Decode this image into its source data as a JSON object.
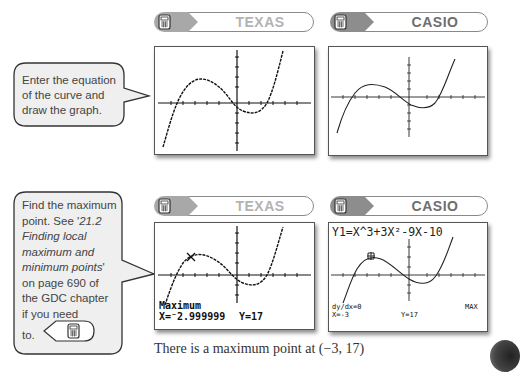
{
  "headers": {
    "texas_label": "TEXAS",
    "casio_label": "CASIO",
    "calculator_icon": "calculator-icon"
  },
  "step1": {
    "instruction": "Enter the equation of the curve and draw the graph.",
    "instruction_lines": [
      "Enter the equation",
      "of the curve and",
      "draw the graph."
    ]
  },
  "step2": {
    "instruction_lines": [
      {
        "text": "Find the maximum",
        "italic": false
      },
      {
        "text": "point. See '",
        "italic": false
      },
      {
        "text": "21.2",
        "italic": true
      },
      {
        "text": "Finding local",
        "italic": true
      },
      {
        "text": "maximum and",
        "italic": true
      },
      {
        "text": "minimum points",
        "italic": true
      },
      {
        "text": "' on page 690 of",
        "italic": false
      },
      {
        "text": "the GDC chapter",
        "italic": false
      },
      {
        "text": "if you need",
        "italic": false
      },
      {
        "text": "to.",
        "italic": false
      }
    ],
    "line1": "Find the maximum",
    "line2a": "point. See '",
    "line2b": "21.2",
    "line3": "Finding local",
    "line4": "maximum and",
    "line5": "minimum points",
    "line5b": "'",
    "line6": "on page 690 of",
    "line7": "the GDC chapter",
    "line8": "if you need",
    "line9": "to.",
    "texas_screen": {
      "label": "Maximum",
      "x_value": "X=⁻2.999999",
      "y_value": "Y=17"
    },
    "casio_screen": {
      "equation": "Y1=X^3+3X²-9X-10",
      "derivative": "dy/dx=0",
      "x_value": "X=-3",
      "y_value": "Y=17",
      "mode": "MAX"
    }
  },
  "caption": "There is a maximum point at (−3, 17)",
  "colors": {
    "texas_label": "#b3b3b3",
    "casio_label": "#6e6e6e",
    "badge_gray": "#9a9a9a",
    "callout_fill": "#f0f0f0",
    "callout_border": "#333333"
  }
}
